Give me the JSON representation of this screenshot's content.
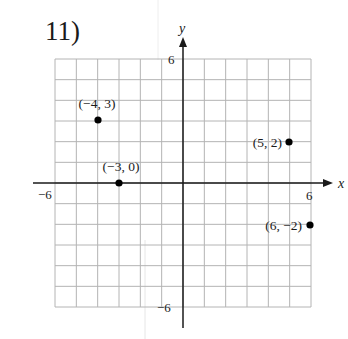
{
  "problem": {
    "number_label": "11)"
  },
  "chart_data": {
    "type": "scatter",
    "title": "11)",
    "xlabel": "x",
    "ylabel": "y",
    "xlim": [
      -6,
      6
    ],
    "ylim": [
      -6,
      6
    ],
    "grid": true,
    "grid_step": 1,
    "tick_labels": {
      "x_min": "−6",
      "x_max": "6",
      "y_min": "−6",
      "y_max": "6"
    },
    "points": [
      {
        "x": -4,
        "y": 3,
        "label": "(−4, 3)"
      },
      {
        "x": -3,
        "y": 0,
        "label": "(−3, 0)"
      },
      {
        "x": 5,
        "y": 2,
        "label": "(5, 2)"
      },
      {
        "x": 6,
        "y": -2,
        "label": "(6, −2)"
      }
    ]
  },
  "colors": {
    "grid": "#b4b4b4",
    "axis": "#1a1a1a",
    "point": "#000000"
  }
}
